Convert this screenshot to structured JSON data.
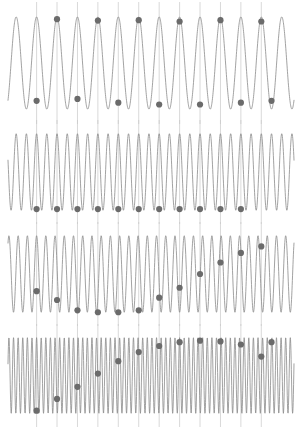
{
  "figure": {
    "title": "",
    "background": "#ffffff",
    "width": 302,
    "height": 429,
    "wave_color": "#8a8a8a",
    "marker_color": "#6b6b6b",
    "grid_color": "#c8c8c8"
  },
  "chart_data": {
    "type": "line",
    "title": "",
    "subtitle": "",
    "xlabel": "",
    "ylabel": "",
    "grid": true,
    "grid_axis": "x",
    "legend": "none",
    "x": [
      0,
      10
    ],
    "xlim": [
      0,
      10
    ],
    "ylim": [
      -1.15,
      1.15
    ],
    "sample_interval": 0.3571,
    "sample_times": [
      1.0,
      1.357,
      1.714,
      2.071,
      2.429,
      2.786,
      3.143,
      3.5,
      3.857,
      4.214,
      4.571,
      4.929,
      5.286,
      5.643,
      6.0,
      6.357,
      6.714,
      7.071,
      7.429,
      7.786,
      8.143,
      8.5,
      8.857,
      9.214
    ],
    "panels": [
      {
        "index": 1,
        "name": "panel-low-frequency",
        "signal_frequency": 1.4,
        "samples_per_cycle": 2.0,
        "wave_cycles": 7,
        "marker_count": 13,
        "marker_values": [
          -0.82,
          0.95,
          -0.78,
          0.92,
          -0.86,
          0.93,
          -0.9,
          0.9,
          -0.9,
          0.93,
          -0.86,
          0.9,
          -0.82
        ],
        "aliased": false
      },
      {
        "index": 2,
        "name": "panel-critical-frequency",
        "signal_frequency": 2.8,
        "samples_per_cycle": 1.0,
        "wave_cycles": 12,
        "marker_count": 11,
        "marker_values": [
          -0.97,
          -0.97,
          -0.97,
          -0.97,
          -0.97,
          -0.97,
          -0.97,
          -0.97,
          -0.97,
          -0.97,
          -0.97
        ],
        "aliased": true,
        "alias_frequency": 0.0
      },
      {
        "index": 3,
        "name": "panel-aliased-frequency",
        "signal_frequency": 3.1,
        "samples_per_cycle": 0.9,
        "wave_cycles": 13,
        "marker_count": 12,
        "marker_values": [
          -0.45,
          -0.68,
          -0.95,
          -1.0,
          -1.0,
          -0.95,
          -0.62,
          -0.36,
          0.0,
          0.3,
          0.55,
          0.72
        ],
        "aliased": true,
        "alias_frequency": 0.3
      },
      {
        "index": 4,
        "name": "panel-highest-frequency",
        "signal_frequency": 6.2,
        "samples_per_cycle": 0.45,
        "wave_cycles": 26,
        "marker_count": 13,
        "marker_values": [
          -0.93,
          -0.62,
          -0.3,
          0.05,
          0.38,
          0.62,
          0.78,
          0.88,
          0.92,
          0.9,
          0.82,
          0.5,
          0.88
        ],
        "aliased": true,
        "alias_frequency": 0.55
      }
    ]
  }
}
